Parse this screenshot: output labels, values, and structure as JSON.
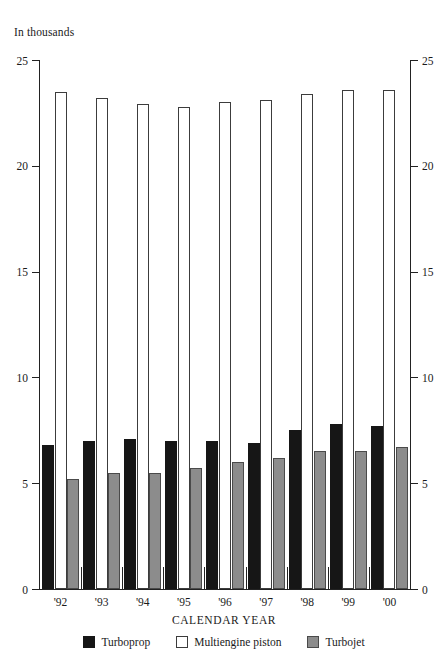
{
  "units_caption": "In thousands",
  "axis": {
    "x_title": "CALENDAR YEAR",
    "y_ticks": [
      "0",
      "5",
      "10",
      "15",
      "20",
      "25"
    ],
    "x_tick_labels": [
      "'92",
      "'93",
      "'94",
      "'95",
      "'96",
      "'97",
      "'98",
      "'99",
      "'00"
    ]
  },
  "legend": {
    "items": [
      {
        "label": "Turboprop",
        "color": "#161616",
        "key": "turboprop"
      },
      {
        "label": "Multiengine piston",
        "color": "#ffffff",
        "key": "piston"
      },
      {
        "label": "Turbojet",
        "color": "#8c8c8c",
        "key": "turbojet"
      }
    ]
  },
  "chart_data": {
    "type": "bar",
    "title": "",
    "subtitle": "",
    "units": "In thousands",
    "xlabel": "CALENDAR YEAR",
    "ylabel": "In thousands",
    "ylim": [
      0,
      25
    ],
    "yticks": [
      0,
      5,
      10,
      15,
      20,
      25
    ],
    "grid": false,
    "legend_position": "bottom",
    "dual_y_axis": true,
    "categories": [
      "'92",
      "'93",
      "'94",
      "'95",
      "'96",
      "'97",
      "'98",
      "'99",
      "'00"
    ],
    "series": [
      {
        "name": "Turboprop",
        "color": "#161616",
        "values": [
          6.8,
          7.0,
          7.1,
          7.0,
          7.0,
          6.9,
          7.5,
          7.8,
          7.7
        ]
      },
      {
        "name": "Multiengine piston",
        "color": "#ffffff",
        "values": [
          23.5,
          23.2,
          22.9,
          22.8,
          23.0,
          23.1,
          23.4,
          23.6,
          23.6
        ]
      },
      {
        "name": "Turbojet",
        "color": "#8c8c8c",
        "values": [
          5.2,
          5.5,
          5.5,
          5.7,
          6.0,
          6.2,
          6.5,
          6.5,
          6.7
        ]
      }
    ]
  }
}
